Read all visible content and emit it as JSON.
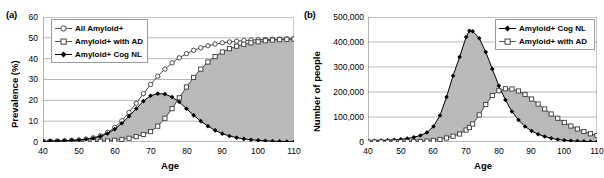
{
  "figure": {
    "panels": [
      {
        "tag": "(a)",
        "xlabel": "Age",
        "ylabel": "Prevalence (%)",
        "yticks": [
          "0",
          "10",
          "20",
          "30",
          "40",
          "50",
          "60"
        ],
        "xticks": [
          "40",
          "50",
          "60",
          "70",
          "80",
          "90",
          "100",
          "110"
        ],
        "legend": [
          {
            "label": "All Amyloid+",
            "marker": "open-circle"
          },
          {
            "label": "Amyloid+ with AD",
            "marker": "open-square"
          },
          {
            "label": "Amyloid+ Cog NL",
            "marker": "filled-diamond"
          }
        ]
      },
      {
        "tag": "(b)",
        "xlabel": "Age",
        "ylabel": "Number of people",
        "yticks": [
          "0",
          "100,000",
          "200,000",
          "300,000",
          "400,000",
          "500,000"
        ],
        "xticks": [
          "40",
          "50",
          "60",
          "70",
          "80",
          "90",
          "100",
          "110"
        ],
        "legend": [
          {
            "label": "Amyloid+ Cog NL",
            "marker": "filled-diamond"
          },
          {
            "label": "Amyloid+ with AD",
            "marker": "open-square"
          }
        ]
      }
    ],
    "colors": {
      "line": "#000000",
      "fill_between": "#b9b9b9",
      "gridline": "#a6a6a6",
      "axis": "#6e6e6e",
      "background": "#ffffff"
    }
  },
  "chart_data": [
    {
      "type": "line",
      "panel": "(a)",
      "title": "",
      "xlabel": "Age",
      "ylabel": "Prevalence (%)",
      "xlim": [
        40,
        110
      ],
      "ylim": [
        0,
        60
      ],
      "ytick_values": [
        0,
        10,
        20,
        30,
        40,
        50,
        60
      ],
      "xtick_values": [
        40,
        50,
        60,
        70,
        80,
        90,
        100,
        110
      ],
      "grid": "horizontal",
      "legend_position": "top-left",
      "shaded_between": [
        "Amyloid+ Cog NL",
        "Amyloid+ with AD"
      ],
      "x": [
        40,
        42,
        44,
        46,
        48,
        50,
        52,
        54,
        56,
        58,
        60,
        62,
        64,
        66,
        68,
        70,
        72,
        74,
        76,
        78,
        80,
        82,
        84,
        86,
        88,
        90,
        92,
        94,
        96,
        98,
        100,
        102,
        104,
        106,
        108,
        110
      ],
      "series": [
        {
          "name": "All Amyloid+",
          "marker": "open-circle",
          "values": [
            0.3,
            0.4,
            0.5,
            0.6,
            0.8,
            1.0,
            1.4,
            2.0,
            3.0,
            4.6,
            7.0,
            10.2,
            14.2,
            18.6,
            23.2,
            27.6,
            31.6,
            35.0,
            38.0,
            40.4,
            42.4,
            44.0,
            45.2,
            46.2,
            47.0,
            47.6,
            48.0,
            48.4,
            48.7,
            48.9,
            49.1,
            49.2,
            49.3,
            49.4,
            49.5,
            49.5
          ]
        },
        {
          "name": "Amyloid+ with AD",
          "marker": "open-square",
          "values": [
            0.0,
            0.0,
            0.0,
            0.0,
            0.0,
            0.1,
            0.1,
            0.2,
            0.3,
            0.5,
            0.8,
            1.2,
            1.8,
            2.6,
            3.6,
            5.0,
            7.6,
            11.4,
            16.0,
            21.2,
            26.4,
            31.0,
            35.0,
            38.4,
            41.0,
            43.2,
            44.8,
            46.0,
            46.9,
            47.6,
            48.1,
            48.6,
            48.9,
            49.1,
            49.3,
            49.4
          ]
        },
        {
          "name": "Amyloid+ Cog NL",
          "marker": "filled-diamond",
          "values": [
            0.3,
            0.4,
            0.5,
            0.6,
            0.8,
            0.9,
            1.3,
            1.8,
            2.7,
            4.1,
            6.2,
            9.0,
            12.4,
            16.0,
            19.6,
            22.2,
            23.2,
            23.0,
            21.6,
            19.2,
            16.0,
            12.8,
            10.0,
            7.6,
            5.6,
            4.0,
            2.9,
            2.1,
            1.5,
            1.1,
            0.8,
            0.6,
            0.4,
            0.3,
            0.2,
            0.1
          ]
        }
      ]
    },
    {
      "type": "line",
      "panel": "(b)",
      "title": "",
      "xlabel": "Age",
      "ylabel": "Number of people",
      "xlim": [
        40,
        110
      ],
      "ylim": [
        0,
        500000
      ],
      "ytick_values": [
        0,
        100000,
        200000,
        300000,
        400000,
        500000
      ],
      "xtick_values": [
        40,
        50,
        60,
        70,
        80,
        90,
        100,
        110
      ],
      "grid": "horizontal",
      "legend_position": "top-right",
      "shaded_between": [
        "Amyloid+ Cog NL",
        "Amyloid+ with AD"
      ],
      "x": [
        40,
        42,
        44,
        46,
        48,
        50,
        52,
        54,
        56,
        58,
        60,
        62,
        64,
        66,
        68,
        70,
        71,
        72,
        74,
        76,
        78,
        80,
        82,
        84,
        86,
        88,
        90,
        92,
        94,
        96,
        98,
        100,
        102,
        104,
        106,
        108,
        110
      ],
      "series": [
        {
          "name": "Amyloid+ Cog NL",
          "marker": "filled-diamond",
          "values": [
            4000,
            5000,
            6000,
            7000,
            9000,
            11000,
            14000,
            19000,
            26000,
            38000,
            62000,
            106000,
            180000,
            265000,
            340000,
            420000,
            445000,
            443000,
            415000,
            360000,
            292000,
            225000,
            168000,
            122000,
            88000,
            62000,
            44000,
            31000,
            22000,
            15000,
            10000,
            7000,
            5000,
            3500,
            2500,
            1500,
            1000
          ]
        },
        {
          "name": "Amyloid+ with AD",
          "marker": "open-square",
          "values": [
            0,
            0,
            0,
            0,
            0,
            500,
            800,
            1200,
            2000,
            3500,
            6000,
            10000,
            16000,
            23000,
            32000,
            48000,
            58000,
            72000,
            108000,
            150000,
            186000,
            205000,
            213000,
            212000,
            204000,
            190000,
            172000,
            152000,
            132000,
            112000,
            95000,
            78000,
            64000,
            52000,
            42000,
            33000,
            26000
          ]
        }
      ]
    }
  ]
}
